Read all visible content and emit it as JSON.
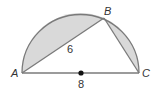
{
  "diagram": {
    "type": "semicircle-inscribed-triangle",
    "points": {
      "A": {
        "label": "A"
      },
      "B": {
        "label": "B"
      },
      "C": {
        "label": "C"
      }
    },
    "labels": {
      "chord_AB": "6",
      "diameter_AC": "8"
    },
    "colors": {
      "stroke": "#7a7a7a",
      "shade": "#d9d9d9",
      "center_dot": "#111111",
      "text": "#333333"
    }
  }
}
